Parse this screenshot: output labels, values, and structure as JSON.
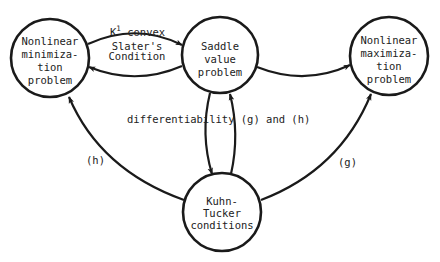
{
  "diagram": {
    "type": "directed-graph",
    "nodes": [
      {
        "id": "min",
        "lines": [
          "Nonlinear",
          "minimiza-",
          "tion",
          "problem"
        ]
      },
      {
        "id": "saddle",
        "lines": [
          "Saddle",
          "value",
          "problem"
        ]
      },
      {
        "id": "max",
        "lines": [
          "Nonlinear",
          "maximiza-",
          "tion",
          "problem"
        ]
      },
      {
        "id": "kt",
        "lines": [
          "Kuhn-",
          "Tucker",
          "conditions"
        ]
      }
    ],
    "edges": [
      {
        "from": "min",
        "to": "saddle",
        "label_main": "K",
        "label_sup": "1",
        "label_rest": " convex",
        "label_line2": "Slater's",
        "label_line3": "Condition"
      },
      {
        "from": "saddle",
        "to": "min",
        "label": ""
      },
      {
        "from": "saddle",
        "to": "max",
        "label": ""
      },
      {
        "from": "saddle",
        "to": "kt",
        "label": "differentiability (g) and (h)"
      },
      {
        "from": "kt",
        "to": "saddle",
        "label": ""
      },
      {
        "from": "kt",
        "to": "min",
        "label": "(h)"
      },
      {
        "from": "kt",
        "to": "max",
        "label": "(g)"
      }
    ],
    "colors": {
      "stroke": "#1a1a1a",
      "background": "#ffffff",
      "text": "#222222"
    }
  }
}
